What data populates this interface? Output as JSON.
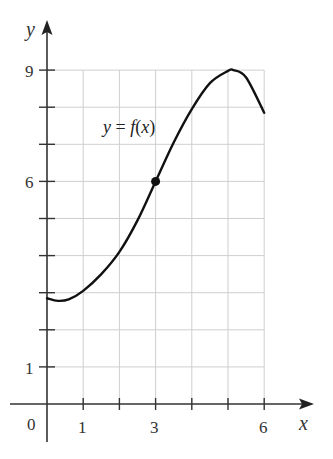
{
  "chart_data": {
    "type": "line",
    "title": "",
    "xlabel": "x",
    "ylabel": "y",
    "xlim": [
      0,
      6
    ],
    "ylim": [
      0,
      9
    ],
    "grid": true,
    "grid_x_range": [
      0,
      6
    ],
    "grid_y_range": [
      1,
      9
    ],
    "x_ticks": [
      1,
      2,
      3,
      4,
      5,
      6
    ],
    "x_tick_labels": [
      {
        "value": 1,
        "label": "1"
      },
      {
        "value": 3,
        "label": "3"
      },
      {
        "value": 6,
        "label": "6"
      }
    ],
    "y_ticks": [
      1,
      2,
      3,
      4,
      5,
      6,
      7,
      8,
      9
    ],
    "y_tick_labels": [
      {
        "value": 1,
        "label": "1"
      },
      {
        "value": 6,
        "label": "6"
      },
      {
        "value": 9,
        "label": "9"
      }
    ],
    "origin_label": "0",
    "series": [
      {
        "name": "y = f(x)",
        "x": [
          0,
          0.3,
          0.6,
          1,
          1.5,
          2,
          2.5,
          3,
          3.5,
          4,
          4.5,
          5,
          5.15,
          5.5,
          6
        ],
        "values": [
          2.85,
          2.78,
          2.82,
          3.05,
          3.5,
          4.1,
          4.95,
          6.0,
          7.05,
          7.95,
          8.65,
          8.98,
          9.0,
          8.8,
          7.85
        ]
      }
    ],
    "highlighted_points": [
      {
        "x": 3,
        "y": 6
      }
    ],
    "annotations": [
      {
        "text": "y = f(x)",
        "x": 1.55,
        "y": 7.4
      }
    ]
  },
  "labels": {
    "curve_label_y": "y",
    "curve_label_eq": " = ",
    "curve_label_f": "f",
    "curve_label_open": "(",
    "curve_label_x": "x",
    "curve_label_close": ")",
    "x_axis": "x",
    "y_axis": "y",
    "origin": "0",
    "x_tick_1": "1",
    "x_tick_3": "3",
    "x_tick_6": "6",
    "y_tick_1": "1",
    "y_tick_6": "6",
    "y_tick_9": "9"
  }
}
